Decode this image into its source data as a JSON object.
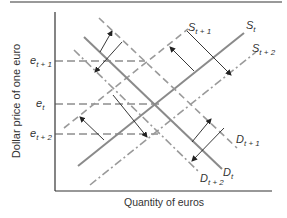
{
  "diagram": {
    "title": "",
    "y_axis_label": "Dollar price of one euro",
    "x_axis_label": "Quantity of euros",
    "price_levels": [
      {
        "id": "e_t1",
        "base": "e",
        "sub": "t + 1"
      },
      {
        "id": "e_t",
        "base": "e",
        "sub": "t"
      },
      {
        "id": "e_t2",
        "base": "e",
        "sub": "t + 2"
      }
    ],
    "curves": {
      "S_t": {
        "base": "S",
        "sub": "t",
        "style": "solid"
      },
      "S_t1": {
        "base": "S",
        "sub": "t + 1",
        "style": "dashed"
      },
      "S_t2": {
        "base": "S",
        "sub": "t + 2",
        "style": "dash-dot"
      },
      "D_t": {
        "base": "D",
        "sub": "t",
        "style": "solid"
      },
      "D_t1": {
        "base": "D",
        "sub": "t + 1",
        "style": "dashed"
      },
      "D_t2": {
        "base": "D",
        "sub": "t + 2",
        "style": "dash-dot"
      }
    },
    "colors": {
      "axis": "#333333",
      "curve": "#8a8a8a",
      "arrow": "#222222",
      "guide": "#555555"
    }
  }
}
